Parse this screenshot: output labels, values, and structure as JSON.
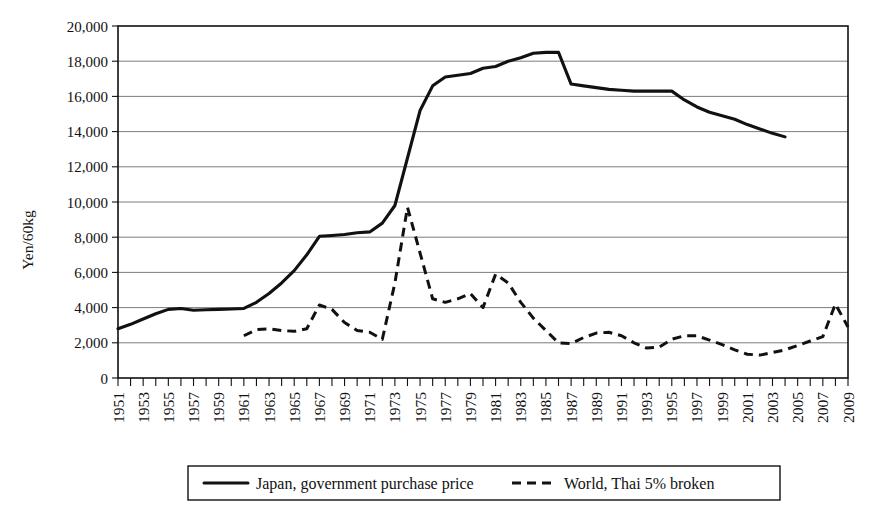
{
  "chart_data": {
    "type": "line",
    "title": "",
    "xlabel": "",
    "ylabel": "Yen/60kg",
    "ylim": [
      0,
      20000
    ],
    "xlim": [
      1951,
      2009
    ],
    "ytick_step": 2000,
    "grid": true,
    "legend_position": "bottom",
    "y_ticks": [
      "0",
      "2,000",
      "4,000",
      "6,000",
      "8,000",
      "10,000",
      "12,000",
      "14,000",
      "16,000",
      "18,000",
      "20,000"
    ],
    "x_ticks": [
      "1951",
      "1953",
      "1955",
      "1957",
      "1959",
      "1961",
      "1963",
      "1965",
      "1967",
      "1969",
      "1971",
      "1973",
      "1975",
      "1977",
      "1979",
      "1981",
      "1983",
      "1985",
      "1987",
      "1989",
      "1991",
      "1993",
      "1995",
      "1997",
      "1999",
      "2001",
      "2003",
      "2005",
      "2007",
      "2009"
    ],
    "x_tick_step_minor": 1,
    "series": [
      {
        "name": "Japan, government purchase price",
        "style": "solid",
        "color": "#111111",
        "x": [
          1951,
          1952,
          1953,
          1954,
          1955,
          1956,
          1957,
          1958,
          1959,
          1960,
          1961,
          1962,
          1963,
          1964,
          1965,
          1966,
          1967,
          1968,
          1969,
          1970,
          1971,
          1972,
          1973,
          1974,
          1975,
          1976,
          1977,
          1978,
          1979,
          1980,
          1981,
          1982,
          1983,
          1984,
          1985,
          1986,
          1987,
          1988,
          1989,
          1990,
          1991,
          1992,
          1993,
          1994,
          1995,
          1996,
          1997,
          1998,
          1999,
          2000,
          2001,
          2002,
          2003,
          2004
        ],
        "values": [
          2800,
          3050,
          3350,
          3650,
          3900,
          3950,
          3850,
          3880,
          3900,
          3920,
          3950,
          4300,
          4800,
          5400,
          6100,
          7000,
          8050,
          8100,
          8150,
          8250,
          8300,
          8800,
          9800,
          12500,
          15200,
          16600,
          17100,
          17200,
          17300,
          17600,
          17700,
          18000,
          18200,
          18450,
          18500,
          18500,
          16700,
          16600,
          16500,
          16400,
          16350,
          16300,
          16300,
          16300,
          16300,
          15800,
          15400,
          15100,
          14900,
          14700,
          14400,
          14150,
          13900,
          13700
        ]
      },
      {
        "name": "World, Thai 5% broken",
        "style": "dashed",
        "color": "#111111",
        "x": [
          1961,
          1962,
          1963,
          1964,
          1965,
          1966,
          1967,
          1968,
          1969,
          1970,
          1971,
          1972,
          1973,
          1974,
          1975,
          1976,
          1977,
          1978,
          1979,
          1980,
          1981,
          1982,
          1983,
          1984,
          1985,
          1986,
          1987,
          1988,
          1989,
          1990,
          1991,
          1992,
          1993,
          1994,
          1995,
          1996,
          1997,
          1998,
          1999,
          2000,
          2001,
          2002,
          2003,
          2004,
          2005,
          2006,
          2007,
          2008,
          2009
        ],
        "values": [
          2400,
          2750,
          2800,
          2700,
          2650,
          2800,
          4150,
          3900,
          3150,
          2700,
          2600,
          2200,
          5400,
          9700,
          7100,
          4500,
          4300,
          4500,
          4800,
          4000,
          5900,
          5400,
          4300,
          3400,
          2700,
          2000,
          1950,
          2300,
          2550,
          2600,
          2400,
          2000,
          1700,
          1750,
          2200,
          2400,
          2400,
          2150,
          1900,
          1600,
          1350,
          1300,
          1450,
          1600,
          1850,
          2100,
          2350,
          4200,
          2900
        ]
      }
    ]
  },
  "legend": {
    "items": [
      {
        "label": "Japan, government purchase price",
        "style": "solid"
      },
      {
        "label": "World, Thai 5% broken",
        "style": "dashed"
      }
    ]
  },
  "axes": {
    "y_title": "Yen/60kg"
  }
}
